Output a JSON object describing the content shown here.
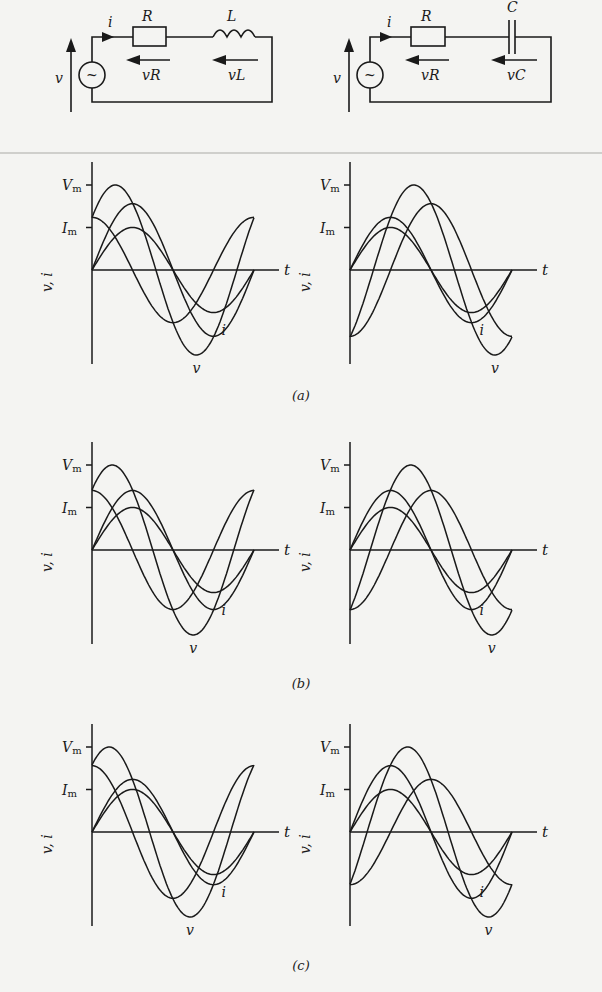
{
  "figure": {
    "circuits": [
      {
        "id": "rl",
        "type": "series RL circuit",
        "labels": {
          "current": "i",
          "resistor": "R",
          "reactive": "L",
          "source_voltage": "v",
          "resistor_voltage": "vR",
          "reactive_voltage": "vL"
        },
        "source_symbol": "~"
      },
      {
        "id": "rc",
        "type": "series RC circuit",
        "labels": {
          "current": "i",
          "resistor": "R",
          "reactive": "C",
          "source_voltage": "v",
          "resistor_voltage": "vR",
          "reactive_voltage": "vC"
        },
        "source_symbol": "~"
      }
    ],
    "captions": {
      "a": "(a)",
      "b": "(b)",
      "c": "(c)"
    },
    "axis_labels": {
      "y": "v, i",
      "x": "t",
      "vmax": "Vm",
      "imax": "Im",
      "curve_i": "i",
      "curve_v": "v"
    }
  },
  "chart_data": [
    {
      "panel": "a-left",
      "circuit": "RL",
      "type": "line",
      "xlabel": "t",
      "ylabel": "v, i",
      "ticks": [
        "Vm",
        "Im"
      ],
      "series": [
        {
          "name": "i",
          "amplitude": 0.5,
          "phase_deg": 0
        },
        {
          "name": "vR",
          "amplitude": 0.78,
          "phase_deg": 0
        },
        {
          "name": "vL",
          "amplitude": 0.62,
          "phase_deg": 90
        },
        {
          "name": "v",
          "amplitude": 1.0,
          "phase_deg": 38
        }
      ]
    },
    {
      "panel": "a-right",
      "circuit": "RC",
      "type": "line",
      "xlabel": "t",
      "ylabel": "v, i",
      "ticks": [
        "Vm",
        "Im"
      ],
      "series": [
        {
          "name": "i",
          "amplitude": 0.5,
          "phase_deg": 0
        },
        {
          "name": "vR",
          "amplitude": 0.62,
          "phase_deg": 0
        },
        {
          "name": "vC",
          "amplitude": 0.78,
          "phase_deg": -90
        },
        {
          "name": "v",
          "amplitude": 1.0,
          "phase_deg": -52
        }
      ]
    },
    {
      "panel": "b-left",
      "circuit": "RL",
      "type": "line",
      "xlabel": "t",
      "ylabel": "v, i",
      "ticks": [
        "Vm",
        "Im"
      ],
      "series": [
        {
          "name": "i",
          "amplitude": 0.5,
          "phase_deg": 0
        },
        {
          "name": "vR",
          "amplitude": 0.7,
          "phase_deg": 0
        },
        {
          "name": "vL",
          "amplitude": 0.7,
          "phase_deg": 90
        },
        {
          "name": "v",
          "amplitude": 1.0,
          "phase_deg": 45
        }
      ]
    },
    {
      "panel": "b-right",
      "circuit": "RC",
      "type": "line",
      "xlabel": "t",
      "ylabel": "v, i",
      "ticks": [
        "Vm",
        "Im"
      ],
      "series": [
        {
          "name": "i",
          "amplitude": 0.5,
          "phase_deg": 0
        },
        {
          "name": "vR",
          "amplitude": 0.7,
          "phase_deg": 0
        },
        {
          "name": "vC",
          "amplitude": 0.7,
          "phase_deg": -90
        },
        {
          "name": "v",
          "amplitude": 1.0,
          "phase_deg": -45
        }
      ]
    },
    {
      "panel": "c-left",
      "circuit": "RL",
      "type": "line",
      "xlabel": "t",
      "ylabel": "v, i",
      "ticks": [
        "Vm",
        "Im"
      ],
      "series": [
        {
          "name": "i",
          "amplitude": 0.5,
          "phase_deg": 0
        },
        {
          "name": "vR",
          "amplitude": 0.62,
          "phase_deg": 0
        },
        {
          "name": "vL",
          "amplitude": 0.78,
          "phase_deg": 90
        },
        {
          "name": "v",
          "amplitude": 1.0,
          "phase_deg": 52
        }
      ]
    },
    {
      "panel": "c-right",
      "circuit": "RC",
      "type": "line",
      "xlabel": "t",
      "ylabel": "v, i",
      "ticks": [
        "Vm",
        "Im"
      ],
      "series": [
        {
          "name": "i",
          "amplitude": 0.5,
          "phase_deg": 0
        },
        {
          "name": "vR",
          "amplitude": 0.78,
          "phase_deg": 0
        },
        {
          "name": "vC",
          "amplitude": 0.62,
          "phase_deg": -90
        },
        {
          "name": "v",
          "amplitude": 1.0,
          "phase_deg": -38
        }
      ]
    }
  ]
}
